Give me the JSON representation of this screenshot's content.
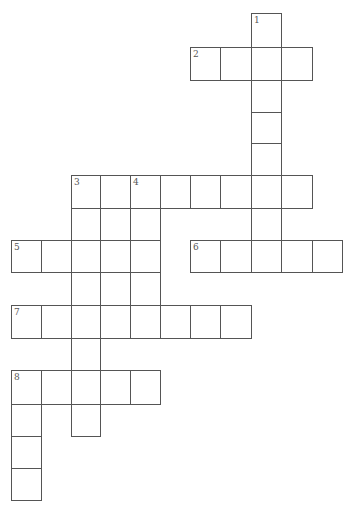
{
  "puzzle": {
    "type": "crossword",
    "colors": {
      "line": "#555555",
      "cell": "#ffffff",
      "number": "#555555"
    },
    "col_x": [
      11,
      41,
      71,
      100,
      130,
      160,
      190,
      220,
      251,
      281,
      312,
      342
    ],
    "row_y": [
      13,
      47,
      80,
      112,
      143,
      175,
      208,
      240,
      272,
      305,
      338,
      370,
      404,
      436,
      468,
      500
    ],
    "entries": [
      {
        "number": "1",
        "direction": "down",
        "row": 0,
        "col": 8,
        "length": 8
      },
      {
        "number": "2",
        "direction": "across",
        "row": 1,
        "col": 6,
        "length": 4
      },
      {
        "number": "3",
        "direction": "across",
        "row": 5,
        "col": 2,
        "length": 8
      },
      {
        "number": "3",
        "direction": "down",
        "row": 5,
        "col": 2,
        "length": 8
      },
      {
        "number": "4",
        "direction": "down",
        "row": 5,
        "col": 4,
        "length": 5
      },
      {
        "number": "5",
        "direction": "across",
        "row": 7,
        "col": 0,
        "length": 5
      },
      {
        "number": "6",
        "direction": "across",
        "row": 7,
        "col": 6,
        "length": 5
      },
      {
        "number": "7",
        "direction": "across",
        "row": 9,
        "col": 0,
        "length": 8
      },
      {
        "number": "8",
        "direction": "across",
        "row": 11,
        "col": 0,
        "length": 5
      },
      {
        "number": "8",
        "direction": "down",
        "row": 11,
        "col": 0,
        "length": 4
      }
    ],
    "extra_cells": [
      {
        "row": 6,
        "col": 3
      },
      {
        "row": 8,
        "col": 3
      }
    ]
  }
}
